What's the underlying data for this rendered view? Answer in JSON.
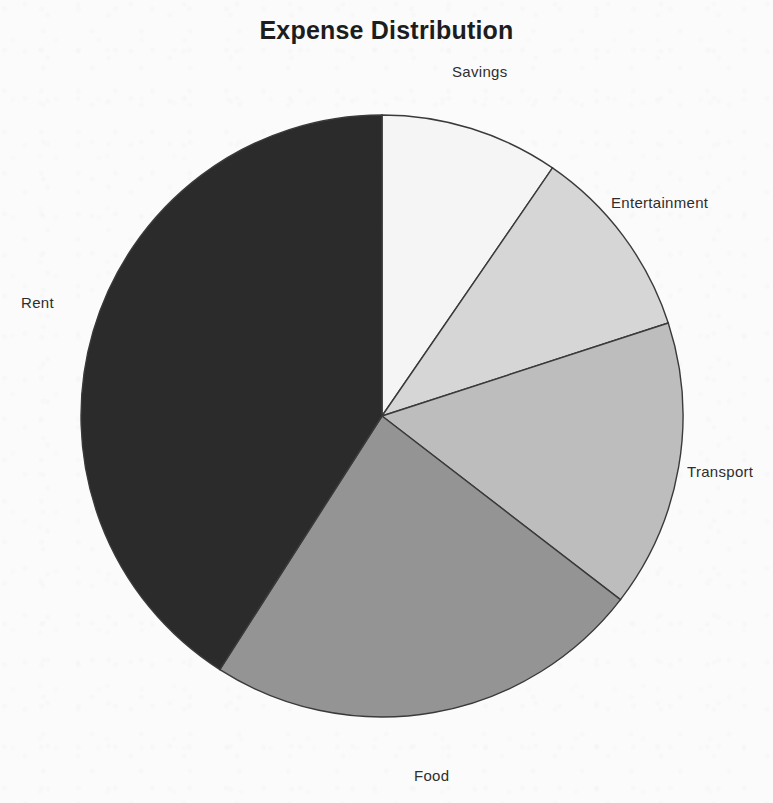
{
  "figure": {
    "title": "Expense Distribution",
    "background_color": "#fbfbfb",
    "text_color": "#2e2e2e"
  },
  "labels": {
    "savings": "Savings",
    "entertainment": "Entertainment",
    "transport": "Transport",
    "food": "Food",
    "rent": "Rent"
  },
  "chart_data": {
    "type": "pie",
    "title": "Expense Distribution",
    "xlabel": "",
    "ylabel": "",
    "grid": false,
    "legend": "none",
    "label_position": "outside",
    "start_angle_deg": 90,
    "direction": "clockwise",
    "center": {
      "x": 382,
      "y": 416
    },
    "radius": 301,
    "wedge_edge_color": "#3a3a3a",
    "categories": [
      "Savings",
      "Entertainment",
      "Transport",
      "Food",
      "Rent"
    ],
    "values": [
      9.6,
      10.4,
      15.4,
      23.6,
      41.0
    ],
    "value_unit": "percent",
    "slices": [
      {
        "label": "Savings",
        "value": 9.6,
        "color": "#f5f5f5",
        "start_angle_deg": 0.0,
        "end_angle_deg": 34.5,
        "label_x": 484,
        "label_y": 72
      },
      {
        "label": "Entertainment",
        "value": 10.4,
        "color": "#d6d6d6",
        "start_angle_deg": 34.5,
        "end_angle_deg": 72.0,
        "label_x": 666,
        "label_y": 203
      },
      {
        "label": "Transport",
        "value": 15.4,
        "color": "#bdbdbd",
        "start_angle_deg": 72.0,
        "end_angle_deg": 127.6,
        "label_x": 724,
        "label_y": 472
      },
      {
        "label": "Food",
        "value": 23.6,
        "color": "#949494",
        "start_angle_deg": 127.6,
        "end_angle_deg": 212.6,
        "label_x": 432,
        "label_y": 776
      },
      {
        "label": "Rent",
        "value": 41.0,
        "color": "#2b2b2b",
        "start_angle_deg": 212.6,
        "end_angle_deg": 360.0,
        "label_x": 38,
        "label_y": 303
      }
    ]
  }
}
